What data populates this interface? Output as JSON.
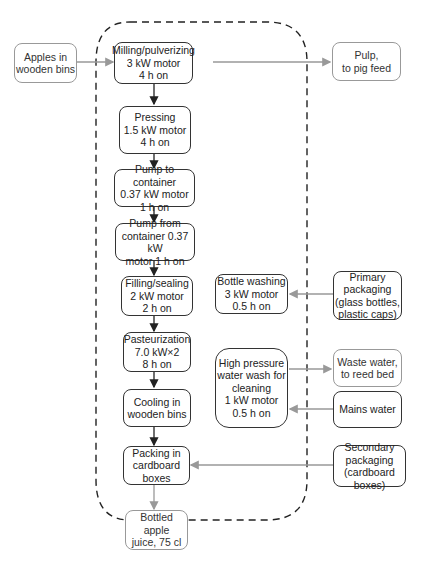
{
  "diagram": {
    "type": "process-flow",
    "boundary": "dashed-system-boundary",
    "inputs": {
      "apples": "Apples in\nwooden bins",
      "primary_packaging": "Primary\npackaging\n(glass bottles,\nplastic caps)",
      "mains_water": "Mains water",
      "secondary_packaging": "Secondary\npackaging\n(cardboard boxes)"
    },
    "outputs": {
      "pulp": "Pulp,\nto pig feed",
      "waste_water": "Waste water,\nto reed bed",
      "bottled_juice": "Bottled apple\njuice, 75 cl"
    },
    "process_steps": [
      {
        "label": "Milling/pulverizing\n3 kW motor\n4 h on"
      },
      {
        "label": "Pressing\n1.5 kW motor\n4 h on"
      },
      {
        "label": "Pump to container\n0.37 kW motor\n1 h on"
      },
      {
        "label": "Pump from\ncontainer 0.37 kW\nmotor 1 h on"
      },
      {
        "label": "Filling/sealing\n2 kW motor\n2 h on"
      },
      {
        "label": "Pasteurization\n7.0 kW×2\n8 h on"
      },
      {
        "label": "Cooling in\nwooden bins"
      },
      {
        "label": "Packing in\ncardboard\nboxes"
      }
    ],
    "side_steps": {
      "bottle_washing": "Bottle washing\n3 kW motor\n0.5 h on",
      "water_wash": "High pressure\nwater wash for\ncleaning\n1 kW motor\n0.5 h on"
    },
    "colors": {
      "main_stroke": "#333333",
      "flow_stroke": "#999999",
      "boundary_stroke": "#222222"
    }
  }
}
